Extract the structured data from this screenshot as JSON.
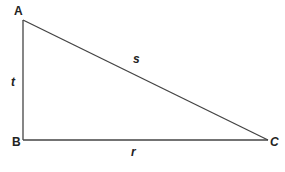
{
  "diagram": {
    "type": "right-triangle",
    "vertices": {
      "A": {
        "label": "A",
        "x": 23,
        "y": 20
      },
      "B": {
        "label": "B",
        "x": 23,
        "y": 140
      },
      "C": {
        "label": "C",
        "x": 268,
        "y": 140
      }
    },
    "sides": {
      "AB": {
        "label": "t"
      },
      "AC": {
        "label": "s"
      },
      "BC": {
        "label": "r"
      }
    },
    "right_angle_at": "B",
    "line_color": "#444444"
  }
}
